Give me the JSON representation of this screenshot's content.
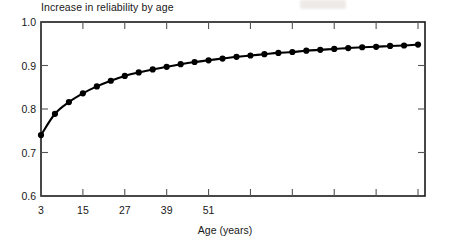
{
  "chart_data": {
    "type": "line",
    "title": "Increase in reliability by age",
    "xlabel": "Age (years)",
    "ylabel": "",
    "xlim": [
      3,
      113
    ],
    "ylim": [
      0.6,
      1.0
    ],
    "grid": false,
    "legend": null,
    "marker": "filled-circle",
    "line_color": "#000000",
    "x_ticks_labeled": [
      3,
      15,
      27,
      39,
      51
    ],
    "x_tick_labels": [
      "3",
      "15",
      "27",
      "39",
      "51"
    ],
    "y_ticks_labeled": [
      0.6,
      0.7,
      0.8,
      0.9,
      1.0
    ],
    "y_tick_labels": [
      "0.6",
      "0.7",
      "0.8",
      "0.9",
      "1.0"
    ],
    "x": [
      3,
      7,
      11,
      15,
      19,
      23,
      27,
      31,
      35,
      39,
      43,
      47,
      51,
      55,
      59,
      63,
      67,
      71,
      75,
      79,
      83,
      87,
      91,
      95,
      99,
      103,
      107,
      111
    ],
    "values": [
      0.74,
      0.789,
      0.816,
      0.836,
      0.852,
      0.865,
      0.876,
      0.884,
      0.891,
      0.897,
      0.903,
      0.908,
      0.912,
      0.916,
      0.92,
      0.923,
      0.926,
      0.929,
      0.931,
      0.934,
      0.936,
      0.938,
      0.94,
      0.942,
      0.943,
      0.945,
      0.946,
      0.948
    ],
    "series": [
      {
        "name": "Reliability",
        "values": [
          0.74,
          0.789,
          0.816,
          0.836,
          0.852,
          0.865,
          0.876,
          0.884,
          0.891,
          0.897,
          0.903,
          0.908,
          0.912,
          0.916,
          0.92,
          0.923,
          0.926,
          0.929,
          0.931,
          0.934,
          0.936,
          0.938,
          0.94,
          0.942,
          0.943,
          0.945,
          0.946,
          0.948
        ]
      }
    ]
  }
}
